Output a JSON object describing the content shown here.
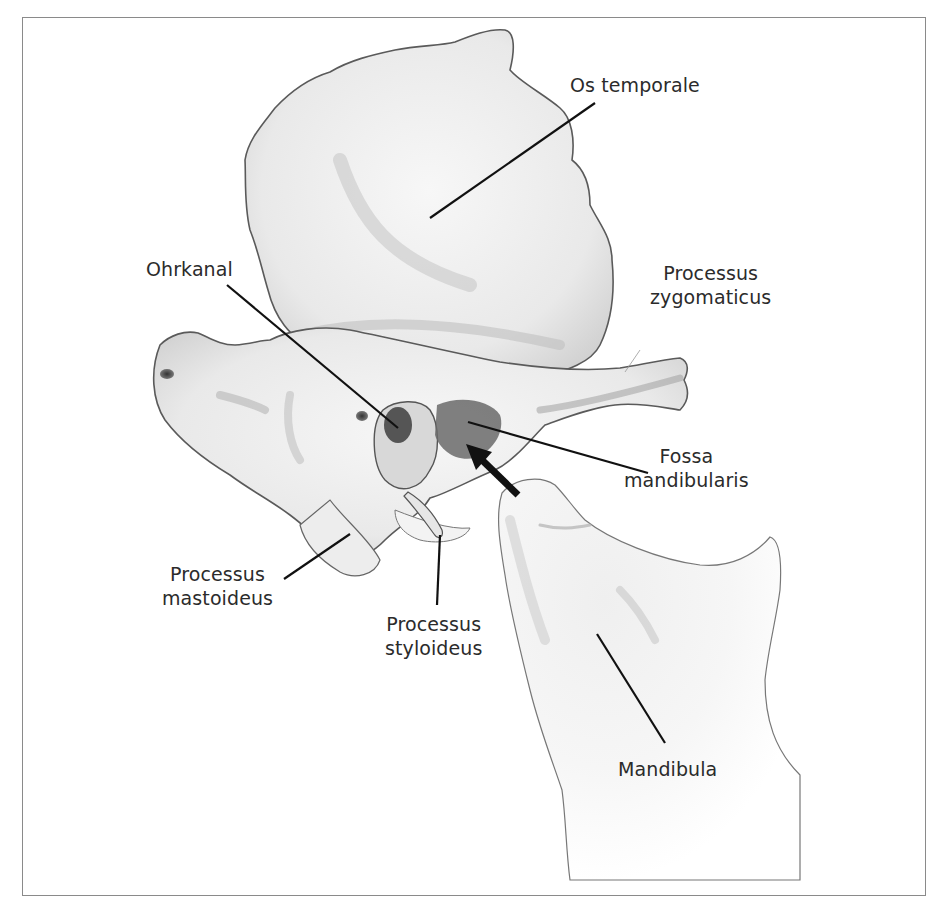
{
  "figure": {
    "type": "anatomical illustration",
    "colors": {
      "frame": "#8a8a8a",
      "bone_fill": "#f1f1f1",
      "bone_shade": "#bdbdbd",
      "outline": "#555555",
      "leader": "#111111",
      "text": "#2b2b2b"
    }
  },
  "labels": {
    "os_temporale": "Os temporale",
    "ohrkanal": "Ohrkanal",
    "processus_zygomaticus": "Processus\nzygomaticus",
    "fossa_mandibularis": "Fossa\nmandibularis",
    "processus_mastoideus": "Processus\nmastoideus",
    "processus_styloideus": "Processus\nstyloideus",
    "mandibula": "Mandibula"
  }
}
